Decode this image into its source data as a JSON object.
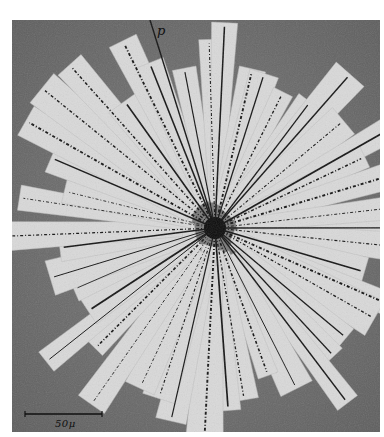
{
  "figure": {
    "track_label": "p",
    "scale_bar": {
      "label": "50μ",
      "length_px": 76
    },
    "colors": {
      "background": "#6f6f6f",
      "strip": "#d9d9d9",
      "track": "#111111",
      "page": "#ffffff"
    },
    "center": {
      "x": 203,
      "y": 208
    }
  }
}
